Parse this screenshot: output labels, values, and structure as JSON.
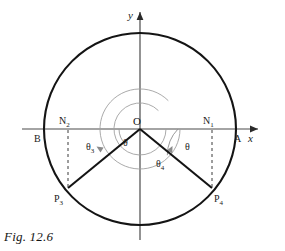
{
  "figure": {
    "caption": "Fig. 12.6",
    "axes": {
      "x_label": "x",
      "y_label": "y"
    },
    "labels": {
      "origin": "O",
      "point_a": "A",
      "point_b": "B",
      "point_n1": "N",
      "point_n1_sub": "1",
      "point_n2": "N",
      "point_n2_sub": "2",
      "point_p3": "P",
      "point_p3_sub": "3",
      "point_p4": "P",
      "point_p4_sub": "4",
      "angle_theta_left": "θ",
      "angle_theta_right": "θ",
      "angle_theta3": "θ",
      "angle_theta3_sub": "3",
      "angle_theta4": "θ",
      "angle_theta4_sub": "4"
    },
    "colors": {
      "stroke_main": "#1a1a1a",
      "stroke_arc": "#9a9a9a",
      "stroke_axis": "#4a4a4a",
      "background": "#ffffff"
    },
    "geometry": {
      "center_x": 140,
      "center_y": 129,
      "radius": 96,
      "n1_x": 212,
      "n2_x": 68,
      "p3_x": 68,
      "p3_y": 188,
      "p4_x": 212,
      "p4_y": 188,
      "inner_arc_radius_small": 26,
      "inner_arc_radius_large": 40
    }
  }
}
